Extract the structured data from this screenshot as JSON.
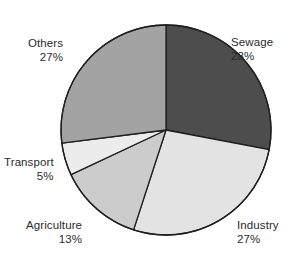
{
  "chart_data": {
    "type": "pie",
    "title": "",
    "subtitle": "",
    "xlabel": "",
    "ylabel": "",
    "legend_position": "none",
    "grid": false,
    "labels_inline": true,
    "start_angle_deg": 0,
    "direction": "clockwise",
    "center": {
      "x": 166,
      "y": 130,
      "radius": 105
    },
    "categories": [
      "Sewage",
      "Industry",
      "Agriculture",
      "Transport",
      "Others"
    ],
    "values": [
      28,
      27,
      13,
      5,
      27
    ],
    "value_suffix": "%",
    "slices": [
      {
        "name": "Sewage",
        "value": 28,
        "value_text": "28%",
        "color": "#4d4d4d",
        "start_deg": 0,
        "end_deg": 100.8,
        "label_side": "right"
      },
      {
        "name": "Industry",
        "value": 27,
        "value_text": "27%",
        "color": "#e3e3e3",
        "start_deg": 100.8,
        "end_deg": 198.0,
        "label_side": "right"
      },
      {
        "name": "Agriculture",
        "value": 13,
        "value_text": "13%",
        "color": "#cccccc",
        "start_deg": 198.0,
        "end_deg": 244.8,
        "label_side": "left"
      },
      {
        "name": "Transport",
        "value": 5,
        "value_text": "5%",
        "color": "#ececec",
        "start_deg": 244.8,
        "end_deg": 262.8,
        "label_side": "left"
      },
      {
        "name": "Others",
        "value": 27,
        "value_text": "27%",
        "color": "#a3a3a3",
        "start_deg": 262.8,
        "end_deg": 360.0,
        "label_side": "left"
      }
    ],
    "stroke_color": "#1f1f1f",
    "background_color": "#ffffff",
    "text_color": "#2b2b2b"
  },
  "labels": {
    "sewage": {
      "name": "Sewage",
      "value": "28%"
    },
    "industry": {
      "name": "Industry",
      "value": "27%"
    },
    "agriculture": {
      "name": "Agriculture",
      "value": "13%"
    },
    "transport": {
      "name": "Transport",
      "value": "5%"
    },
    "others": {
      "name": "Others",
      "value": "27%"
    }
  }
}
